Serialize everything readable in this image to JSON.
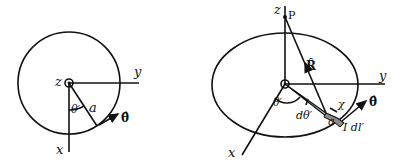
{
  "left_figure": {
    "labels": {
      "z": "z",
      "y": "y",
      "x": "x",
      "theta_prime": "θ′",
      "radius": "a",
      "theta_hat": "θ̂"
    }
  },
  "right_figure": {
    "labels": {
      "z": "z",
      "point": "P",
      "R_hat": "R̂",
      "y": "y",
      "x": "x",
      "theta_prime": "θ′",
      "dtheta_prime": "dθ′",
      "radius": "a",
      "chi": "χ",
      "theta_hat": "θ̂",
      "current_element": "I dl′"
    }
  }
}
